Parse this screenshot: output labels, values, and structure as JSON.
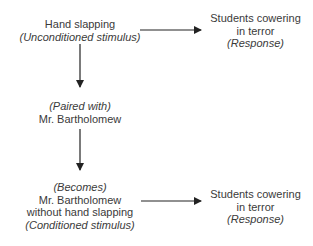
{
  "diagram": {
    "nodes": {
      "ucs": {
        "line1": "Hand slapping",
        "line2": "(Unconditioned stimulus)"
      },
      "response_top": {
        "line1": "Students cowering",
        "line2": "in terror",
        "line3": "(Response)"
      },
      "paired": {
        "line1": "(Paired with)",
        "line2": "Mr. Bartholomew"
      },
      "cs": {
        "line1": "(Becomes)",
        "line2": "Mr. Bartholomew",
        "line3": "without hand slapping",
        "line4": "(Conditioned stimulus)"
      },
      "response_bottom": {
        "line1": "Students cowering",
        "line2": "in terror",
        "line3": "(Response)"
      }
    },
    "edges": [
      {
        "from": "ucs",
        "to": "response_top"
      },
      {
        "from": "ucs",
        "to": "paired"
      },
      {
        "from": "paired",
        "to": "cs"
      },
      {
        "from": "cs",
        "to": "response_bottom"
      }
    ],
    "colors": {
      "text": "#3a3a3a",
      "line": "#222222"
    }
  }
}
